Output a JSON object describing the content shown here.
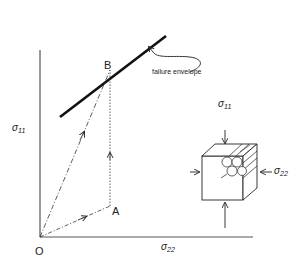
{
  "diagram": {
    "axes": {
      "y_label_symbol": "σ",
      "y_label_sub": "11",
      "x_label_symbol": "σ",
      "x_label_sub": "22"
    },
    "points": {
      "origin": "O",
      "a": "A",
      "b": "B"
    },
    "annotation": "failure envelope",
    "element": {
      "top_load_symbol": "σ",
      "top_load_sub": "11",
      "side_load_symbol": "σ",
      "side_load_sub": "22"
    },
    "colors": {
      "line": "#222222",
      "envelope": "#111111",
      "background": "#ffffff"
    }
  }
}
